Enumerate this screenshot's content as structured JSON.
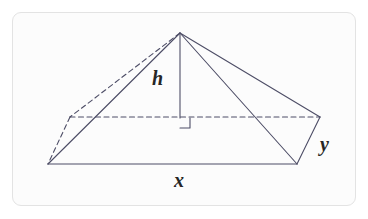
{
  "figure": {
    "kind": "geometry-diagram",
    "shape": "rectangular-pyramid",
    "background_color": "#fcfcfc",
    "frame_color": "#e3e3e3",
    "line_color": "#4d4d66",
    "label_color": "#262626",
    "labels": {
      "height": "h",
      "base_length": "x",
      "base_width": "y"
    },
    "markers": {
      "right_angle": "right-angle-square"
    },
    "vertices": {
      "apex": [
        180,
        33
      ],
      "front_left": [
        48,
        164
      ],
      "front_right": [
        297,
        164
      ],
      "back_left": [
        70,
        117
      ],
      "back_right": [
        320,
        117
      ],
      "height_foot": [
        180,
        118
      ]
    },
    "edges_solid": [
      "apex-front_left",
      "apex-front_right",
      "apex-back_right",
      "front_left-front_right",
      "front_right-back_right"
    ],
    "edges_dashed": [
      "apex-back_left",
      "back_left-back_right",
      "back_left-front_left"
    ],
    "height_segment": "apex-height_foot"
  }
}
